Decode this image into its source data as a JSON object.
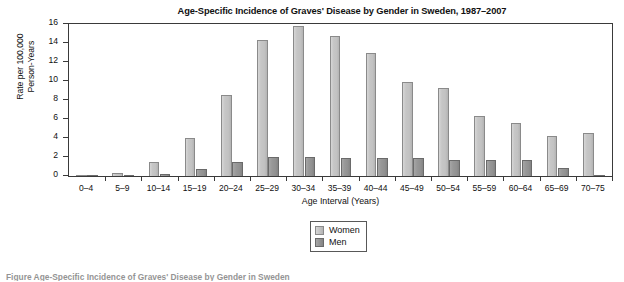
{
  "chart_data": {
    "type": "bar",
    "title": "Age-Specific Incidence of Graves' Disease by Gender in Sweden, 1987–2007",
    "xlabel": "Age Interval (Years)",
    "ylabel": "Rate per 100,000\nPerson-Years",
    "ylabel_line1": "Rate per 100,000",
    "ylabel_line2": "Person-Years",
    "ylim": [
      0,
      16
    ],
    "yticks": [
      0,
      2,
      4,
      6,
      8,
      10,
      12,
      14,
      16
    ],
    "ytick_labels": [
      "0",
      "2",
      "4",
      "6",
      "8",
      "10",
      "12",
      "14",
      "16"
    ],
    "grid": false,
    "legend_position": "below-center",
    "categories": [
      "0–4",
      "5–9",
      "10–14",
      "15–19",
      "20–24",
      "25–29",
      "30–34",
      "35–39",
      "40–44",
      "45–49",
      "50–54",
      "55–59",
      "60–64",
      "65–69",
      "70–75"
    ],
    "series": [
      {
        "name": "Women",
        "color": "#c2c2c2",
        "values": [
          0.1,
          0.35,
          1.5,
          4.0,
          8.5,
          14.3,
          15.8,
          14.7,
          13.0,
          9.9,
          9.3,
          6.3,
          5.6,
          4.2,
          4.5
        ]
      },
      {
        "name": "Men",
        "color": "#919191",
        "values": [
          0.05,
          0.1,
          0.25,
          0.75,
          1.5,
          1.95,
          1.95,
          1.9,
          1.9,
          1.9,
          1.7,
          1.7,
          1.65,
          0.8,
          0.15
        ]
      }
    ]
  },
  "legend": {
    "items": [
      {
        "label": "Women",
        "key": "women"
      },
      {
        "label": "Men",
        "key": "men"
      }
    ]
  },
  "caption": {
    "text": "Figure   Age-Specific Incidence of Graves' Disease by Gender in Sweden"
  }
}
